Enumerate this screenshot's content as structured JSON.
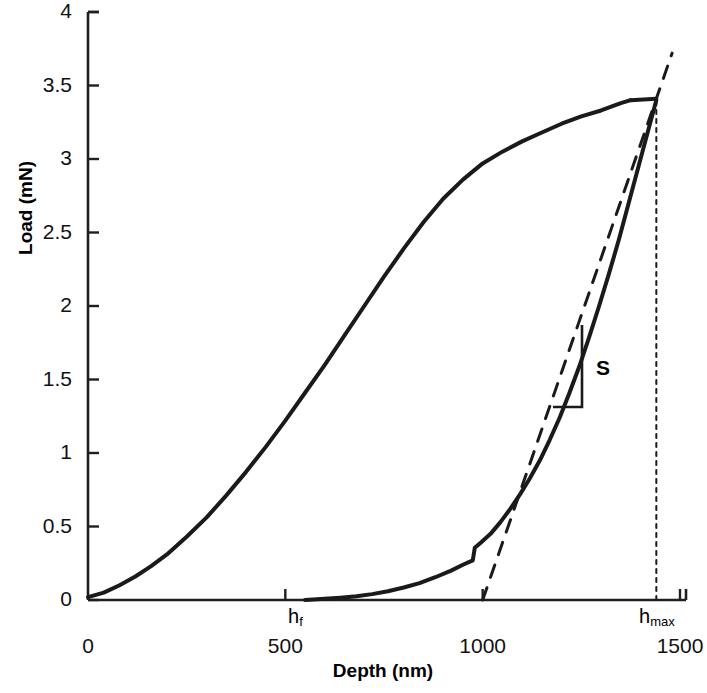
{
  "figure": {
    "kind": "load-depth-curve",
    "background": "#ffffff",
    "ink_color": "#1a1a1a"
  },
  "axes": {
    "y_title": "Load (mN)",
    "x_title": "Depth (nm)",
    "y_ticks": [
      "0",
      "0.5",
      "1",
      "1.5",
      "2",
      "2.5",
      "3",
      "3.5",
      "4"
    ],
    "x_ticks": [
      "0",
      "500",
      "1000",
      "1500"
    ]
  },
  "annotations": {
    "slope_label": "S",
    "hf_label": "h",
    "hf_sub": "f",
    "hmax_label": "h",
    "hmax_sub": "max"
  },
  "chart_data": {
    "type": "line",
    "title": "",
    "xlabel": "Depth (nm)",
    "ylabel": "Load (mN)",
    "xlim": [
      0,
      1500
    ],
    "ylim": [
      0,
      4
    ],
    "xticks": [
      0,
      500,
      1000,
      1500
    ],
    "yticks": [
      0,
      0.5,
      1,
      1.5,
      2,
      2.5,
      3,
      3.5,
      4
    ],
    "grid": false,
    "legend": null,
    "annotations": [
      {
        "name": "h_f",
        "text": "h_f",
        "x": 550,
        "y": 0,
        "note": "final / residual depth where unloading curve returns to zero load"
      },
      {
        "name": "h_max",
        "text": "h_max",
        "x": 1440,
        "y": 0,
        "note": "maximum penetration depth, dotted vertical drop line"
      },
      {
        "name": "S",
        "text": "S",
        "x": 1310,
        "y": 1.55,
        "note": "contact stiffness, slope of initial unloading; dashed tangent line"
      }
    ],
    "markers": {
      "peak_load_mN": 3.4,
      "max_depth_nm": 1440,
      "final_depth_nm": 550,
      "tangent_x_intercept_nm": 1000
    },
    "series": [
      {
        "name": "loading",
        "style": "solid",
        "width": 4,
        "points": [
          [
            0,
            0.02
          ],
          [
            40,
            0.05
          ],
          [
            80,
            0.1
          ],
          [
            120,
            0.16
          ],
          [
            160,
            0.23
          ],
          [
            200,
            0.31
          ],
          [
            250,
            0.43
          ],
          [
            300,
            0.56
          ],
          [
            350,
            0.71
          ],
          [
            400,
            0.87
          ],
          [
            450,
            1.04
          ],
          [
            500,
            1.22
          ],
          [
            550,
            1.41
          ],
          [
            600,
            1.6
          ],
          [
            650,
            1.8
          ],
          [
            700,
            2.0
          ],
          [
            750,
            2.2
          ],
          [
            800,
            2.39
          ],
          [
            850,
            2.57
          ],
          [
            900,
            2.73
          ],
          [
            950,
            2.86
          ],
          [
            1000,
            2.97
          ],
          [
            1050,
            3.05
          ],
          [
            1100,
            3.12
          ],
          [
            1150,
            3.18
          ],
          [
            1200,
            3.24
          ],
          [
            1250,
            3.29
          ],
          [
            1300,
            3.33
          ],
          [
            1350,
            3.38
          ],
          [
            1375,
            3.4
          ]
        ]
      },
      {
        "name": "hold",
        "style": "solid",
        "width": 4,
        "points": [
          [
            1375,
            3.4
          ],
          [
            1440,
            3.41
          ]
        ]
      },
      {
        "name": "unloading",
        "style": "solid",
        "width": 4,
        "points": [
          [
            1440,
            3.4
          ],
          [
            1420,
            3.2
          ],
          [
            1395,
            2.95
          ],
          [
            1370,
            2.7
          ],
          [
            1345,
            2.45
          ],
          [
            1320,
            2.22
          ],
          [
            1295,
            2.0
          ],
          [
            1270,
            1.79
          ],
          [
            1245,
            1.59
          ],
          [
            1220,
            1.41
          ],
          [
            1195,
            1.24
          ],
          [
            1170,
            1.09
          ],
          [
            1145,
            0.95
          ],
          [
            1120,
            0.83
          ],
          [
            1095,
            0.72
          ],
          [
            1070,
            0.62
          ],
          [
            1045,
            0.53
          ],
          [
            1020,
            0.45
          ],
          [
            995,
            0.39
          ],
          [
            980,
            0.355
          ],
          [
            975,
            0.27
          ],
          [
            950,
            0.24
          ],
          [
            920,
            0.2
          ],
          [
            880,
            0.155
          ],
          [
            840,
            0.115
          ],
          [
            800,
            0.085
          ],
          [
            760,
            0.06
          ],
          [
            720,
            0.04
          ],
          [
            680,
            0.026
          ],
          [
            640,
            0.016
          ],
          [
            600,
            0.008
          ],
          [
            570,
            0.003
          ],
          [
            550,
            0.0
          ]
        ]
      },
      {
        "name": "tangent-stiffness",
        "style": "dashed",
        "width": 3,
        "points": [
          [
            1000,
            0.0
          ],
          [
            1480,
            3.72
          ]
        ]
      },
      {
        "name": "hmax-dropline",
        "style": "dotted",
        "width": 2,
        "points": [
          [
            1440,
            0.0
          ],
          [
            1440,
            3.4
          ]
        ]
      }
    ]
  }
}
